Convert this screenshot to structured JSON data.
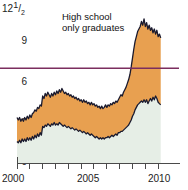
{
  "chart_data": {
    "type": "area",
    "title": "",
    "subtitle": "",
    "xlabel": "",
    "ylabel": "",
    "unit": "percent unemployment rate",
    "stacked": false,
    "grid": false,
    "legend_position": "inline-annotations",
    "xlim": [
      2000,
      2011.3
    ],
    "ylim": [
      0,
      12.5
    ],
    "yticks": [
      0,
      3,
      6,
      9,
      12.5
    ],
    "ytick_labels": [
      "0",
      "3",
      "6",
      "9",
      "12½"
    ],
    "xticks": [
      2000,
      2001,
      2002,
      2003,
      2004,
      2005,
      2006,
      2007,
      2008,
      2009,
      2010,
      2011
    ],
    "xtick_labels": [
      "2000",
      "",
      "",
      "",
      "",
      "2005",
      "",
      "",
      "",
      "",
      "2010",
      ""
    ],
    "reference_line": {
      "label": "",
      "value": 7.5,
      "color": "#7B2D5E"
    },
    "colors": {
      "high_school_fill": "#E8A050",
      "college_fill": "#E6EEE6",
      "line": "#1a1a2e",
      "reference": "#7B2D5E",
      "axis": "#4a4a4a",
      "background": "#ffffff"
    },
    "annotations": [
      {
        "name": "high-school-label",
        "text": "High school\nonly graduates",
        "line1": "High school",
        "line2": "only graduates"
      },
      {
        "name": "college-label",
        "text": "College graduates"
      }
    ],
    "series": [
      {
        "name": "High school only graduates",
        "fill": "#E8A050",
        "x": [
          2000.0,
          2000.1,
          2000.2,
          2000.3,
          2000.4,
          2000.5,
          2000.6,
          2000.7,
          2000.8,
          2000.9,
          2001.0,
          2001.1,
          2001.2,
          2001.3,
          2001.4,
          2001.5,
          2001.6,
          2001.7,
          2001.8,
          2001.9,
          2002.0,
          2002.1,
          2002.2,
          2002.3,
          2002.4,
          2002.5,
          2002.6,
          2002.7,
          2002.8,
          2002.9,
          2003.0,
          2003.1,
          2003.2,
          2003.3,
          2003.4,
          2003.5,
          2003.6,
          2003.7,
          2003.8,
          2003.9,
          2004.0,
          2004.1,
          2004.2,
          2004.3,
          2004.4,
          2004.5,
          2004.6,
          2004.7,
          2004.8,
          2004.9,
          2005.0,
          2005.1,
          2005.2,
          2005.3,
          2005.4,
          2005.5,
          2005.6,
          2005.7,
          2005.8,
          2005.9,
          2006.0,
          2006.1,
          2006.2,
          2006.3,
          2006.4,
          2006.5,
          2006.6,
          2006.7,
          2006.8,
          2006.9,
          2007.0,
          2007.1,
          2007.2,
          2007.3,
          2007.4,
          2007.5,
          2007.6,
          2007.7,
          2007.8,
          2007.9,
          2008.0,
          2008.1,
          2008.2,
          2008.3,
          2008.4,
          2008.5,
          2008.6,
          2008.7,
          2008.8,
          2008.9,
          2009.0,
          2009.1,
          2009.2,
          2009.3,
          2009.4,
          2009.5,
          2009.6,
          2009.7,
          2009.8,
          2009.9,
          2010.0,
          2010.1,
          2010.2,
          2010.3,
          2010.4,
          2010.5,
          2010.6,
          2010.7,
          2010.8,
          2010.9,
          2011.0,
          2011.1,
          2011.2
        ],
        "values": [
          3.6,
          3.4,
          3.6,
          3.3,
          3.5,
          3.3,
          3.6,
          3.4,
          3.7,
          3.5,
          3.8,
          3.6,
          3.9,
          4.0,
          4.2,
          4.1,
          4.4,
          4.3,
          4.6,
          4.5,
          5.3,
          5.1,
          5.5,
          5.3,
          5.6,
          5.4,
          5.2,
          5.5,
          5.3,
          5.6,
          5.4,
          5.7,
          5.5,
          5.8,
          5.6,
          5.9,
          5.7,
          5.5,
          5.6,
          5.4,
          5.5,
          5.3,
          5.4,
          5.2,
          5.3,
          5.1,
          5.2,
          5.0,
          5.1,
          4.9,
          5.0,
          4.8,
          5.0,
          4.8,
          4.9,
          4.7,
          4.8,
          4.6,
          4.8,
          4.6,
          4.7,
          4.5,
          4.6,
          4.4,
          4.5,
          4.3,
          4.5,
          4.3,
          4.4,
          4.6,
          4.4,
          4.6,
          4.5,
          4.7,
          4.6,
          4.8,
          4.7,
          4.9,
          4.8,
          5.0,
          5.2,
          5.4,
          5.3,
          5.6,
          5.8,
          6.0,
          6.3,
          6.6,
          7.0,
          7.6,
          8.3,
          9.0,
          9.6,
          10.0,
          10.4,
          10.6,
          10.8,
          11.2,
          10.9,
          11.4,
          10.8,
          11.1,
          10.6,
          10.9,
          10.5,
          10.7,
          10.3,
          10.6,
          10.2,
          10.5,
          10.0,
          10.2,
          9.9
        ]
      },
      {
        "name": "College graduates",
        "fill": "#E6EEE6",
        "x": [
          2000.0,
          2000.1,
          2000.2,
          2000.3,
          2000.4,
          2000.5,
          2000.6,
          2000.7,
          2000.8,
          2000.9,
          2001.0,
          2001.1,
          2001.2,
          2001.3,
          2001.4,
          2001.5,
          2001.6,
          2001.7,
          2001.8,
          2001.9,
          2002.0,
          2002.1,
          2002.2,
          2002.3,
          2002.4,
          2002.5,
          2002.6,
          2002.7,
          2002.8,
          2002.9,
          2003.0,
          2003.1,
          2003.2,
          2003.3,
          2003.4,
          2003.5,
          2003.6,
          2003.7,
          2003.8,
          2003.9,
          2004.0,
          2004.1,
          2004.2,
          2004.3,
          2004.4,
          2004.5,
          2004.6,
          2004.7,
          2004.8,
          2004.9,
          2005.0,
          2005.1,
          2005.2,
          2005.3,
          2005.4,
          2005.5,
          2005.6,
          2005.7,
          2005.8,
          2005.9,
          2006.0,
          2006.1,
          2006.2,
          2006.3,
          2006.4,
          2006.5,
          2006.6,
          2006.7,
          2006.8,
          2006.9,
          2007.0,
          2007.1,
          2007.2,
          2007.3,
          2007.4,
          2007.5,
          2007.6,
          2007.7,
          2007.8,
          2007.9,
          2008.0,
          2008.1,
          2008.2,
          2008.3,
          2008.4,
          2008.5,
          2008.6,
          2008.7,
          2008.8,
          2008.9,
          2009.0,
          2009.1,
          2009.2,
          2009.3,
          2009.4,
          2009.5,
          2009.6,
          2009.7,
          2009.8,
          2009.9,
          2010.0,
          2010.1,
          2010.2,
          2010.3,
          2010.4,
          2010.5,
          2010.6,
          2010.7,
          2010.8,
          2010.9,
          2011.0,
          2011.1,
          2011.2
        ],
        "values": [
          1.7,
          1.6,
          1.8,
          1.6,
          1.9,
          1.7,
          1.9,
          1.7,
          2.0,
          1.8,
          2.0,
          1.8,
          2.1,
          1.9,
          2.2,
          2.0,
          2.3,
          2.1,
          2.4,
          2.2,
          2.9,
          2.8,
          3.0,
          2.9,
          3.1,
          3.0,
          2.9,
          3.1,
          3.0,
          3.2,
          3.0,
          3.1,
          3.0,
          3.2,
          3.1,
          3.0,
          2.9,
          3.0,
          2.9,
          2.8,
          2.9,
          2.8,
          2.7,
          2.8,
          2.7,
          2.6,
          2.7,
          2.6,
          2.5,
          2.6,
          2.5,
          2.4,
          2.5,
          2.4,
          2.3,
          2.4,
          2.3,
          2.2,
          2.3,
          2.2,
          2.1,
          2.0,
          2.1,
          2.0,
          1.9,
          2.0,
          1.9,
          2.0,
          1.9,
          2.0,
          2.0,
          2.1,
          2.0,
          2.1,
          2.2,
          2.1,
          2.2,
          2.3,
          2.2,
          2.4,
          2.4,
          2.5,
          2.5,
          2.6,
          2.7,
          2.8,
          2.9,
          3.0,
          3.2,
          3.4,
          3.7,
          3.9,
          4.2,
          4.4,
          4.6,
          4.7,
          4.8,
          4.9,
          4.8,
          5.0,
          4.8,
          5.0,
          4.7,
          4.9,
          5.1,
          4.9,
          5.2,
          5.0,
          5.3,
          5.1,
          4.8,
          4.7,
          4.6
        ]
      }
    ]
  },
  "axis": {
    "y_labels": [
      {
        "text": "12½",
        "value": 12.5,
        "html_frac": true
      },
      {
        "text": "9",
        "value": 9
      },
      {
        "text": "6",
        "value": 6
      },
      {
        "text": "3",
        "value": 3
      },
      {
        "text": "0",
        "value": 0
      }
    ],
    "x_labels": [
      {
        "text": "2000",
        "value": 2000
      },
      {
        "text": "2005",
        "value": 2005
      },
      {
        "text": "2010",
        "value": 2010
      }
    ]
  },
  "labels": {
    "high_school_line1": "High school",
    "high_school_line2": "only graduates",
    "college": "College graduates"
  }
}
